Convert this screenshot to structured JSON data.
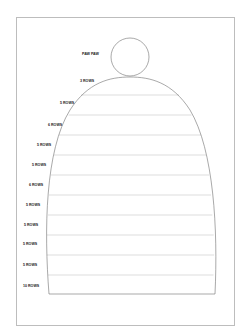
{
  "page": {
    "top_cut_text": "page",
    "diagram": {
      "title_label": "PAW PAW",
      "tiers": [
        {
          "label": "3 ROWS"
        },
        {
          "label": "5 ROWS"
        },
        {
          "label": "6 ROWS"
        },
        {
          "label": "5 ROWS"
        },
        {
          "label": "5 ROWS"
        },
        {
          "label": "6 ROWS"
        },
        {
          "label": "5 ROWS"
        },
        {
          "label": "5 ROWS"
        },
        {
          "label": "5 ROWS"
        },
        {
          "label": "5 ROWS"
        },
        {
          "label": "10 ROWS"
        }
      ],
      "colors": {
        "outline": "#6e6e6e",
        "row_line": "#c8c8c8",
        "label": "#222222"
      }
    }
  }
}
